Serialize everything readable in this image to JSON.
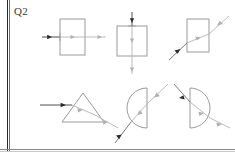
{
  "page": {
    "question_label": "Q2",
    "background_color": "#ffffff",
    "rule_color": "#2b2b2b",
    "shape_stroke_color": "#9a9a9a",
    "ray_incident_color": "#3a3a3a",
    "ray_internal_color": "#b0b0b0",
    "ray_exit_color": "#b0b0b0"
  },
  "figures": [
    {
      "id": "fig-1",
      "name": "rectangle-normal-incidence",
      "shape": "rectangle",
      "row": 1,
      "column": 1,
      "ray_direction": "left-to-right horizontal",
      "arrow_count": 3,
      "description": "Horizontal ray entering a vertical rectangular block at normal incidence and passing straight through",
      "x": 60,
      "y": 19,
      "w": 25,
      "h": 36
    },
    {
      "id": "fig-2",
      "name": "square-vertical-normal-incidence",
      "shape": "square",
      "row": 1,
      "column": 2,
      "ray_direction": "top-to-bottom vertical",
      "arrow_count": 3,
      "description": "Vertical ray entering the top face of a square block at normal incidence and passing straight down",
      "x": 117,
      "y": 26,
      "w": 30,
      "h": 30
    },
    {
      "id": "fig-3",
      "name": "rectangle-oblique-incidence",
      "shape": "rectangle",
      "row": 1,
      "column": 3,
      "ray_direction": "lower-left to upper-right diagonal",
      "arrow_count": 3,
      "description": "Oblique ray crossing a vertical rectangular block, refracting on entry and exit",
      "x": 187,
      "y": 19,
      "w": 22,
      "h": 33
    },
    {
      "id": "fig-4",
      "name": "triangular-prism",
      "shape": "triangle",
      "row": 2,
      "column": 1,
      "ray_direction": "left-to-right horizontal entering, deviating downward on exit",
      "arrow_count": 3,
      "description": "Horizontal ray entering the left face of a triangular prism and deviating downward to the right",
      "x": 62,
      "y": 93,
      "w": 42,
      "h": 29
    },
    {
      "id": "fig-5",
      "name": "semicircle-flat-right",
      "shape": "semicircle",
      "row": 2,
      "column": 2,
      "flat_side": "right",
      "ray_direction": "lower-left to upper-right diagonal",
      "arrow_count": 3,
      "description": "Ray entering the curved surface of a semicircular block with the flat face on the right",
      "x": 125,
      "y": 88,
      "w": 22,
      "h": 40
    },
    {
      "id": "fig-6",
      "name": "semicircle-flat-left",
      "shape": "semicircle",
      "row": 2,
      "column": 3,
      "flat_side": "left",
      "ray_direction": "upper-left to lower-right diagonal",
      "arrow_count": 3,
      "description": "Ray entering the flat face of a semicircular block with the flat face on the left and the curve bulging right",
      "x": 188,
      "y": 88,
      "w": 22,
      "h": 40
    }
  ]
}
